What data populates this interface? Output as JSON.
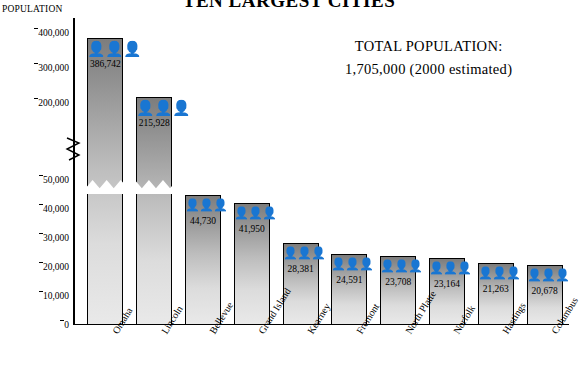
{
  "chart_data": {
    "type": "bar",
    "title": "TEN LARGEST CITIES",
    "ylabel": "POPULATION",
    "xlabel": "",
    "categories": [
      "Omaha",
      "Lincoln",
      "Bellevue",
      "Grand Island",
      "Kearney",
      "Fremont",
      "North Platte",
      "Norfolk",
      "Hastings",
      "Columbus"
    ],
    "values": [
      386742,
      215928,
      44730,
      41950,
      28381,
      24591,
      23708,
      23164,
      21263,
      20678
    ],
    "value_labels": [
      "386,742",
      "215,928",
      "44,730",
      "41,950",
      "28,381",
      "24,591",
      "23,708",
      "23,164",
      "21,263",
      "20,678"
    ],
    "yticks": [
      0,
      10000,
      20000,
      30000,
      40000,
      50000,
      200000,
      300000,
      400000
    ],
    "ytick_labels": [
      "0",
      "10,000",
      "20,000",
      "30,000",
      "40,000",
      "50,000",
      "200,000",
      "300,000",
      "400,000"
    ],
    "axis_break": true,
    "grid": false,
    "legend": false,
    "annotations": {
      "total_label": "TOTAL POPULATION:",
      "total_value": "1,705,000  (2000 estimated)"
    },
    "icon": "people-icon"
  }
}
